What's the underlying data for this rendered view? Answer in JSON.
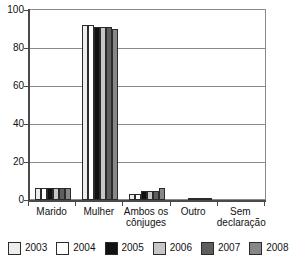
{
  "chart_data": {
    "type": "bar",
    "title": "",
    "subtitle": "",
    "xlabel": "",
    "ylabel": "",
    "ylim": [
      0,
      100
    ],
    "yticks": [
      0,
      20,
      40,
      60,
      80,
      100
    ],
    "grid": true,
    "legend_position": "bottom",
    "categories": [
      "Marido",
      "Mulher",
      "Ambos os cônjuges",
      "Outro",
      "Sem declaração"
    ],
    "category_lines": [
      [
        "Marido"
      ],
      [
        "Mulher"
      ],
      [
        "Ambos os",
        "cônjuges"
      ],
      [
        "Outro"
      ],
      [
        "Sem",
        "declaração"
      ]
    ],
    "series": [
      {
        "name": "2003",
        "color": "#ededed",
        "values": [
          6.2,
          92.0,
          3.4,
          0.0,
          0.0
        ]
      },
      {
        "name": "2004",
        "color": "#ffffff",
        "values": [
          6.2,
          92.0,
          3.4,
          0.0,
          0.0
        ]
      },
      {
        "name": "2005",
        "color": "#111111",
        "values": [
          6.1,
          91.2,
          4.9,
          1.1,
          0.0
        ]
      },
      {
        "name": "2006",
        "color": "#c6c6c6",
        "values": [
          6.1,
          91.0,
          4.9,
          1.1,
          0.0
        ]
      },
      {
        "name": "2007",
        "color": "#5e5e5e",
        "values": [
          6.2,
          90.8,
          4.9,
          1.1,
          0.0
        ]
      },
      {
        "name": "2008",
        "color": "#878787",
        "values": [
          6.2,
          90.2,
          6.2,
          1.1,
          0.0
        ]
      }
    ]
  },
  "legend": {
    "items": [
      {
        "label": "2003",
        "color": "#ededed"
      },
      {
        "label": "2004",
        "color": "#ffffff"
      },
      {
        "label": "2005",
        "color": "#111111"
      },
      {
        "label": "2006",
        "color": "#c6c6c6"
      },
      {
        "label": "2007",
        "color": "#5e5e5e"
      },
      {
        "label": "2008",
        "color": "#878787"
      }
    ]
  },
  "axes": {
    "y_ticks": [
      "0",
      "20",
      "40",
      "60",
      "80",
      "100"
    ]
  }
}
